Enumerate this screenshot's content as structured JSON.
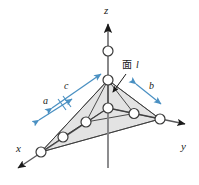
{
  "figure": {
    "name": "lattice-plane-intercepts-diagram",
    "background_color": "#ffffff"
  },
  "colors": {
    "axis": "#58585a",
    "line": "#3a3a3a",
    "plane_fill": "#e3e3e3",
    "plane_stroke": "#5a5a5a",
    "node_fill": "#ffffff",
    "node_stroke": "#3a3a3a",
    "annotation_blue": "#4a90c2",
    "text": "#1a1a1a",
    "arrowhead": "#1a1a1a"
  },
  "axes": [
    {
      "id": "z-axis",
      "label": "z",
      "label_x": 104,
      "label_y": 14
    },
    {
      "id": "y-axis",
      "label": "y",
      "label_x": 181,
      "label_y": 150
    },
    {
      "id": "x-axis",
      "label": "x",
      "label_x": 16,
      "label_y": 152
    }
  ],
  "annotations": {
    "plane_label_kanji": "面",
    "plane_label_letter": "l",
    "plane_label_x": 126,
    "plane_label_y": 70,
    "dimensions": [
      {
        "id": "dim-c",
        "label": "c",
        "label_x": 64,
        "label_y": 89
      },
      {
        "id": "dim-a",
        "label": "a",
        "label_x": 43,
        "label_y": 104
      },
      {
        "id": "dim-b",
        "label": "b",
        "label_x": 149,
        "label_y": 89
      }
    ]
  },
  "geometry": {
    "origin": {
      "x": 108,
      "y": 108
    },
    "z_apex": {
      "x": 108,
      "y": 80
    },
    "z_upper_node": {
      "x": 108,
      "y": 51
    },
    "y_far_node": {
      "x": 160,
      "y": 119
    },
    "x_far_node": {
      "x": 41,
      "y": 152
    },
    "plane_vertices": [
      {
        "x": 108,
        "y": 80
      },
      {
        "x": 160,
        "y": 119
      },
      {
        "x": 41,
        "y": 152
      }
    ]
  },
  "nodes": [
    {
      "id": "node-z-upper",
      "x": 108,
      "y": 51
    },
    {
      "id": "node-z-apex",
      "x": 108,
      "y": 80
    },
    {
      "id": "node-origin",
      "x": 108,
      "y": 108
    },
    {
      "id": "node-y-mid",
      "x": 134,
      "y": 113.5
    },
    {
      "id": "node-y-far",
      "x": 160,
      "y": 119
    },
    {
      "id": "node-x-mid1",
      "x": 86,
      "y": 122
    },
    {
      "id": "node-x-mid2",
      "x": 63,
      "y": 137
    },
    {
      "id": "node-x-far",
      "x": 41,
      "y": 152
    }
  ]
}
